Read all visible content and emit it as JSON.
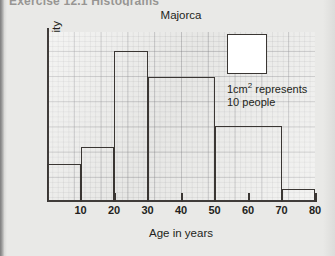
{
  "page": {
    "cropped_header_text": "Exercise 12.1  Histograms",
    "background_color": "#e9e9e7"
  },
  "chart_data": {
    "type": "bar",
    "title": "Majorca",
    "xlabel": "Age in years",
    "ylabel": "Frequency density",
    "grid": true,
    "legend": "none",
    "xlim": [
      0,
      80
    ],
    "ylim": [
      0,
      4.5
    ],
    "xticks": [
      "10",
      "20",
      "30",
      "40",
      "50",
      "60",
      "70",
      "80"
    ],
    "yticks": [],
    "bins": [
      {
        "label": "0-10",
        "x0": 0,
        "x1": 10,
        "value": 1.0
      },
      {
        "label": "10-20",
        "x0": 10,
        "x1": 20,
        "value": 1.45
      },
      {
        "label": "20-30",
        "x0": 20,
        "x1": 30,
        "value": 4.0
      },
      {
        "label": "30-50",
        "x0": 30,
        "x1": 50,
        "value": 3.3
      },
      {
        "label": "50-70",
        "x0": 50,
        "x1": 70,
        "value": 2.0
      },
      {
        "label": "70-80",
        "x0": 70,
        "x1": 80,
        "value": 0.35
      }
    ],
    "annotations": {
      "key_line1": "1cm",
      "key_exponent": "2",
      "key_line1_tail": " represents",
      "key_line2": "10 people"
    },
    "colors": {
      "bar_outline": "#3a3633",
      "axis": "#403c3a",
      "grid_line": "#787880",
      "key_fill": "#ffffff",
      "text": "#231f20"
    }
  }
}
